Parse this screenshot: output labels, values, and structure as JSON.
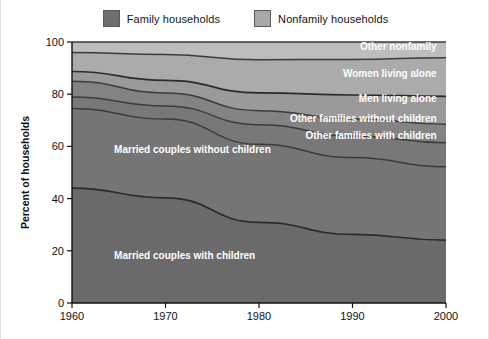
{
  "legend": {
    "items": [
      {
        "label": "Family households",
        "color": "#6e6e6e",
        "name": "legend-family"
      },
      {
        "label": "Nonfamily households",
        "color": "#a8a8a8",
        "name": "legend-nonfamily"
      }
    ]
  },
  "chart_data": {
    "type": "area",
    "stacked": true,
    "title": "",
    "xlabel": "",
    "ylabel": "Percent of households",
    "xlim": [
      1960,
      2000
    ],
    "ylim": [
      0,
      100
    ],
    "grid": false,
    "legend_position": "top-center",
    "xticks": [
      "1960",
      "1970",
      "1980",
      "1990",
      "2000"
    ],
    "yticks": [
      "0",
      "20",
      "40",
      "60",
      "80",
      "100"
    ],
    "x": [
      1960,
      1970,
      1980,
      1990,
      2000
    ],
    "series": [
      {
        "name": "Married couples with children",
        "group": "Family households",
        "color": "#6a6a6a",
        "values": [
          44.0,
          40.3,
          30.9,
          26.3,
          24.1
        ],
        "label_x": 1964.5,
        "label_y": 17.0,
        "label_anchor": "start"
      },
      {
        "name": "Married couples without children",
        "group": "Family households",
        "color": "#757575",
        "values": [
          30.5,
          30.2,
          29.9,
          29.4,
          28.1
        ],
        "label_x": 1964.5,
        "label_y": 57.5,
        "label_anchor": "start"
      },
      {
        "name": "Other families with children",
        "group": "Family households",
        "color": "#787878",
        "values": [
          4.4,
          5.0,
          7.5,
          8.3,
          9.2
        ],
        "label_x": 1999.0,
        "label_y": 63.0,
        "label_anchor": "end"
      },
      {
        "name": "Other families without children",
        "group": "Family households",
        "color": "#838383",
        "values": [
          6.1,
          5.0,
          5.4,
          6.6,
          7.1
        ],
        "label_x": 1999.0,
        "label_y": 69.5,
        "label_anchor": "end"
      },
      {
        "name": "Men living alone",
        "group": "Nonfamily households",
        "color": "#9a9a9a",
        "values": [
          3.7,
          4.8,
          6.8,
          9.1,
          10.7
        ],
        "label_x": 1999.0,
        "label_y": 77.0,
        "label_anchor": "end"
      },
      {
        "name": "Women living alone",
        "group": "Nonfamily households",
        "color": "#ababab",
        "values": [
          7.3,
          9.9,
          12.7,
          13.6,
          14.8
        ],
        "label_x": 1999.0,
        "label_y": 86.5,
        "label_anchor": "end"
      },
      {
        "name": "Other nonfamily",
        "group": "Nonfamily households",
        "color": "#bdbdbd",
        "values": [
          4.0,
          4.8,
          6.8,
          6.7,
          6.0
        ],
        "label_x": 1999.0,
        "label_y": 96.8,
        "label_anchor": "end"
      }
    ]
  }
}
